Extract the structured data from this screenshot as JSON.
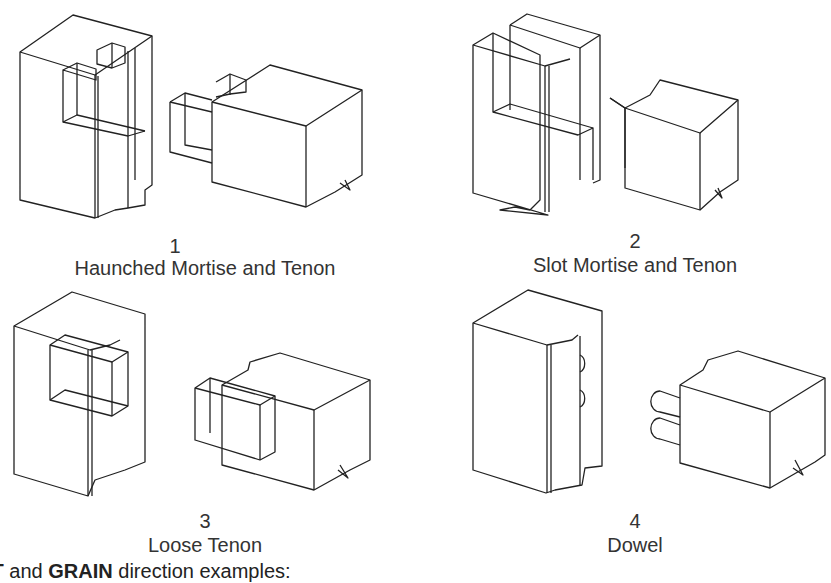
{
  "figures": [
    {
      "number": "1",
      "caption": "Haunched Mortise and Tenon"
    },
    {
      "number": "2",
      "caption": "Slot Mortise and Tenon"
    },
    {
      "number": "3",
      "caption": "Loose Tenon"
    },
    {
      "number": "4",
      "caption": "Dowel"
    }
  ],
  "footer": {
    "bold1": "IT",
    "text1": " and ",
    "bold2": "GRAIN",
    "text2": " direction examples:"
  }
}
